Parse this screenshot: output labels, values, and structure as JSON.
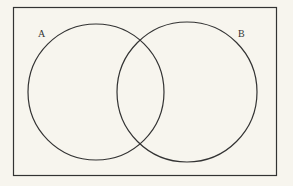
{
  "diagram": {
    "type": "venn",
    "sets": [
      {
        "label": "A",
        "cx": 96,
        "cy": 92,
        "r": 68
      },
      {
        "label": "B",
        "cx": 187,
        "cy": 92,
        "r": 70
      }
    ],
    "frame": {
      "x": 13.5,
      "y": 7.5,
      "width": 263,
      "height": 168
    },
    "colors": {
      "background": "#f7f5ee",
      "stroke": "#333333"
    }
  }
}
